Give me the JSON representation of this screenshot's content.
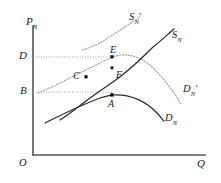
{
  "figure": {
    "background_color": "#ffffff",
    "ink_color": "#1a1a1a",
    "dotted_color": "#8c8c8c"
  },
  "axes": {
    "y_axis": {
      "name": "vertical-axis",
      "label_main": "P",
      "label_sub": "N",
      "x_px": 33,
      "top_px": 26,
      "bottom_px": 155
    },
    "x_axis": {
      "name": "horizontal-axis",
      "label_main": "Q",
      "label_sub": "",
      "y_px": 155,
      "left_px": 33,
      "right_px": 205
    },
    "origin": {
      "label": "O",
      "x_px": 20,
      "y_px": 162
    }
  },
  "price_levels": [
    {
      "id": "D",
      "label": "D",
      "y_px": 57,
      "gridline": true,
      "style": "dotted",
      "extends_to_x": 112
    },
    {
      "id": "B",
      "label": "B",
      "y_px": 92,
      "gridline": true,
      "style": "dotted",
      "extends_to_x": 112
    }
  ],
  "curves": [
    {
      "id": "supply-original",
      "label_main": "S",
      "label_sub": "N",
      "prime": "",
      "style": "solid",
      "label_x_px": 175,
      "label_y_px": 36,
      "path": "M 60,120 C 80,112 100,102 112,95 C 130,84 150,64 175,42"
    },
    {
      "id": "supply-shifted",
      "label_main": "S",
      "label_sub": "N",
      "prime": "′",
      "style": "dotted",
      "label_x_px": 131,
      "label_y_px": 18,
      "path": "M 83,49 C 95,46 105,43 112,38 C 125,32 138,25 148,20"
    },
    {
      "id": "demand-original",
      "label_main": "D",
      "label_sub": "N",
      "prime": "",
      "style": "solid",
      "label_x_px": 166,
      "label_y_px": 120,
      "path": "M 45,122 C 70,110 95,100 112,95 C 135,92 152,102 163,117"
    },
    {
      "id": "demand-shifted",
      "label_main": "D",
      "label_sub": "N",
      "prime": "′",
      "style": "dotted",
      "label_x_px": 186,
      "label_y_px": 90,
      "path": "M 38,93 C 60,84 90,66 112,57 C 140,52 165,78 180,103"
    }
  ],
  "points": [
    {
      "id": "A",
      "label": "A",
      "x_px": 112,
      "y_px": 95,
      "label_dx": -2,
      "label_dy": 13,
      "marker": true
    },
    {
      "id": "B_pt",
      "label": "",
      "x_px": 0,
      "y_px": 0,
      "marker": false
    },
    {
      "id": "C",
      "label": "C",
      "x_px": 86,
      "y_px": 78,
      "label_dx": -13,
      "label_dy": 2,
      "marker": true
    },
    {
      "id": "E",
      "label": "E",
      "x_px": 112,
      "y_px": 57,
      "label_dx": -3,
      "label_dy": -5,
      "marker": true
    },
    {
      "id": "F",
      "label": "F",
      "x_px": 112,
      "y_px": 70,
      "label_dx": 4,
      "label_dy": 10,
      "marker": true
    }
  ],
  "notes": {
    "curve_count": 4,
    "point_count": 4,
    "gridline_count": 2
  }
}
